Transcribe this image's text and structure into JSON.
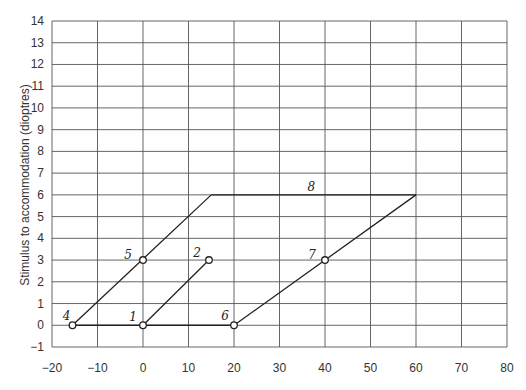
{
  "chart_data": {
    "type": "line",
    "title": "",
    "xlabel": "",
    "ylabel": "Stimulus to accommodation (dioptres)",
    "xlim": [
      -20,
      80
    ],
    "ylim": [
      -1,
      14
    ],
    "grid": true,
    "x_ticks": [
      "−20",
      "−10",
      "0",
      "10",
      "20",
      "30",
      "40",
      "50",
      "60",
      "70",
      "80"
    ],
    "y_ticks": [
      "−1",
      "0",
      "1",
      "2",
      "3",
      "4",
      "5",
      "6",
      "7",
      "8",
      "9",
      "10",
      "11",
      "12",
      "13",
      "14"
    ],
    "points": [
      {
        "label": "1",
        "x": 0,
        "y": 0,
        "marker": true
      },
      {
        "label": "2",
        "x": 14.5,
        "y": 3,
        "marker": true
      },
      {
        "label": "4",
        "x": -15.5,
        "y": 0,
        "marker": true
      },
      {
        "label": "5",
        "x": 0,
        "y": 3,
        "marker": true
      },
      {
        "label": "6",
        "x": 20,
        "y": 0,
        "marker": true
      },
      {
        "label": "7",
        "x": 40,
        "y": 3,
        "marker": true
      },
      {
        "label": "8",
        "x": 37,
        "y": 6,
        "marker": false
      }
    ],
    "series": [
      {
        "name": "4-1-6 baseline",
        "x": [
          -15.5,
          20
        ],
        "y": [
          0,
          0
        ]
      },
      {
        "name": "1-2",
        "x": [
          0,
          14.5
        ],
        "y": [
          0,
          3
        ]
      },
      {
        "name": "4-5-top",
        "x": [
          -15.5,
          15
        ],
        "y": [
          0,
          6
        ]
      },
      {
        "name": "8 top line",
        "x": [
          15,
          60
        ],
        "y": [
          6,
          6
        ]
      },
      {
        "name": "6-7-top",
        "x": [
          20,
          60
        ],
        "y": [
          0,
          6
        ]
      }
    ],
    "annotations": [
      "1",
      "2",
      "4",
      "5",
      "6",
      "7",
      "8"
    ]
  }
}
